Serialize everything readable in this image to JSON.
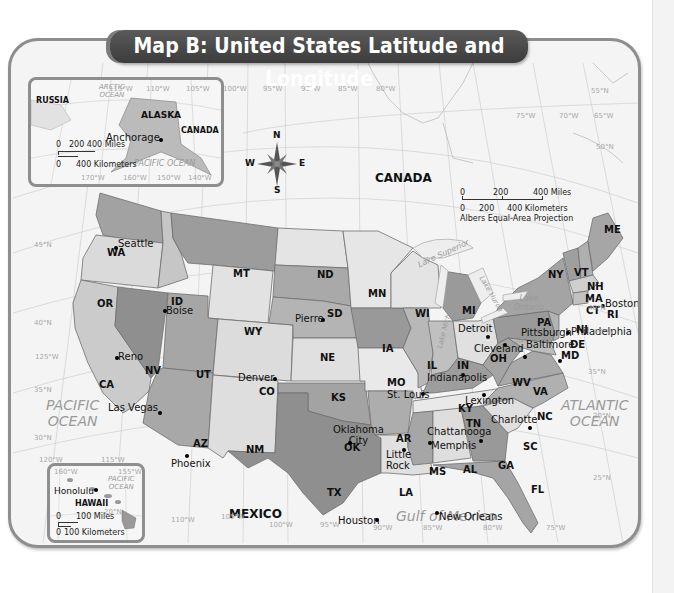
{
  "title": "Map B: United States Latitude and Longitude",
  "colors": {
    "state_dark": "#8e8e8e",
    "state_medium": "#b0b0b0",
    "state_light": "#d6d6d6",
    "state_pale": "#e8e8e8",
    "ocean": "#f4f4f4",
    "frame": "#8e8e8e",
    "title_bg": "#474747"
  },
  "countries": {
    "canada": "CANADA",
    "mexico": "MEXICO",
    "russia": "RUSSIA",
    "canada_inset": "CANADA"
  },
  "water": {
    "pacific_ocean": [
      "PACIFIC",
      "OCEAN"
    ],
    "atlantic_ocean": [
      "ATLANTIC",
      "OCEAN"
    ],
    "gulf_of_mexico": "Gulf of Mexico",
    "arctic_ocean": [
      "ARCTIC",
      "OCEAN"
    ],
    "pacific_ocean_alaska": "PACIFIC OCEAN",
    "pacific_ocean_hawaii": [
      "PACIFIC",
      "OCEAN"
    ],
    "lake_superior": "Lake Superior",
    "lake_michigan": "Lake Michigan",
    "lake_huron": "Lake Huron",
    "lake_erie": "Lake Erie",
    "lake_ontario": [
      "Lake",
      "Ontario"
    ]
  },
  "states": {
    "WA": "WA",
    "OR": "OR",
    "CA": "CA",
    "ID": "ID",
    "NV": "NV",
    "MT": "MT",
    "WY": "WY",
    "UT": "UT",
    "AZ": "AZ",
    "CO": "CO",
    "NM": "NM",
    "ND": "ND",
    "SD": "SD",
    "NE": "NE",
    "KS": "KS",
    "OK": "OK",
    "TX": "TX",
    "MN": "MN",
    "IA": "IA",
    "MO": "MO",
    "AR": "AR",
    "LA": "LA",
    "WI": "WI",
    "IL": "IL",
    "MI": "MI",
    "IN": "IN",
    "OH": "OH",
    "KY": "KY",
    "TN": "TN",
    "MS": "MS",
    "AL": "AL",
    "GA": "GA",
    "FL": "FL",
    "SC": "SC",
    "NC": "NC",
    "VA": "VA",
    "WV": "WV",
    "PA": "PA",
    "NY": "NY",
    "VT": "VT",
    "NH": "NH",
    "ME": "ME",
    "MA": "MA",
    "CT": "CT",
    "RI": "RI",
    "NJ": "NJ",
    "DE": "DE",
    "MD": "MD"
  },
  "cities": {
    "seattle": "Seattle",
    "boise": "Boise",
    "reno": "Reno",
    "las_vegas": "Las Vegas",
    "phoenix": "Phoenix",
    "denver": "Denver",
    "pierre": "Pierre",
    "oklahoma_city": [
      "Oklahoma",
      "City"
    ],
    "houston": "Houston",
    "st_louis": "St. Louis",
    "little_rock": [
      "Little",
      "Rock"
    ],
    "memphis": "Memphis",
    "new_orleans": "New Orleans",
    "indianapolis": "Indianapolis",
    "lexington": "Lexington",
    "chattanooga": "Chattanooga",
    "charlotte": "Charlotte",
    "detroit": "Detroit",
    "cleveland": "Cleveland",
    "pittsburgh": "Pittsburgh",
    "baltimore": "Baltimore",
    "philadelphia": "Philadelphia",
    "boston": "Boston",
    "miami": "Miami",
    "anchorage": "Anchorage",
    "honolulu": "Honolulu"
  },
  "inset_labels": {
    "alaska": "ALASKA",
    "hawaii": "HAWAII"
  },
  "compass": {
    "n": "N",
    "s": "S",
    "e": "E",
    "w": "W"
  },
  "scale_main": {
    "miles": [
      "0",
      "200",
      "400 Miles"
    ],
    "km": [
      "0",
      "200",
      "400 Kilometers"
    ],
    "projection": "Albers Equal-Area Projection"
  },
  "scale_alaska": {
    "miles": [
      "0",
      "200 400 Miles"
    ],
    "km": [
      "0",
      "400 Kilometers"
    ]
  },
  "scale_hawaii": {
    "miles": [
      "0",
      "100 Miles"
    ],
    "km": [
      "0",
      "100 Kilometers"
    ]
  },
  "longitudes_top": [
    "115°W",
    "110°W",
    "105°W",
    "100°W",
    "95°W",
    "90°W",
    "85°W",
    "80°W"
  ],
  "longitudes_right": [
    "75°W",
    "70°W",
    "65°W"
  ],
  "longitudes_bottom": [
    "110°W",
    "105°W",
    "100°W",
    "95°W",
    "90°W",
    "85°W",
    "80°W",
    "75°W"
  ],
  "longitudes_left": [
    "125°W",
    "120°W",
    "115°W"
  ],
  "latitudes_left": [
    "45°N",
    "40°N",
    "35°N",
    "30°N"
  ],
  "latitudes_right": [
    "55°N",
    "50°N",
    "40°N",
    "35°N",
    "30°N",
    "25°N"
  ],
  "alaska_grid": [
    "170°W",
    "160°W",
    "150°W",
    "140°W",
    "180°",
    "60°N",
    "50°N"
  ],
  "hawaii_grid": [
    "160°W",
    "155°W",
    "20°N"
  ],
  "misc_grid": {
    "lon_70_east": "70°W"
  }
}
